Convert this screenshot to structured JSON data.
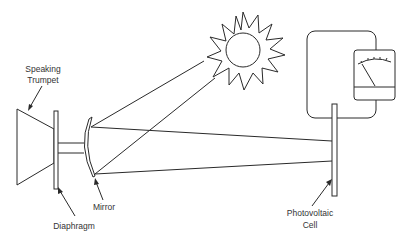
{
  "diagram": {
    "labels": {
      "speaking_trumpet_line1": "Speaking",
      "speaking_trumpet_line2": "Trumpet",
      "diaphragm": "Diaphragm",
      "mirror": "Mirror",
      "photovoltaic_line1": "Photovoltaic",
      "photovoltaic_line2": "Cell"
    },
    "components": [
      "speaking-trumpet",
      "diaphragm",
      "mirror",
      "sun",
      "light-beams",
      "photovoltaic-cell",
      "circuit-loop",
      "meter"
    ],
    "colors": {
      "line": "#2a2a2a",
      "background": "#ffffff",
      "text": "#333333"
    }
  }
}
